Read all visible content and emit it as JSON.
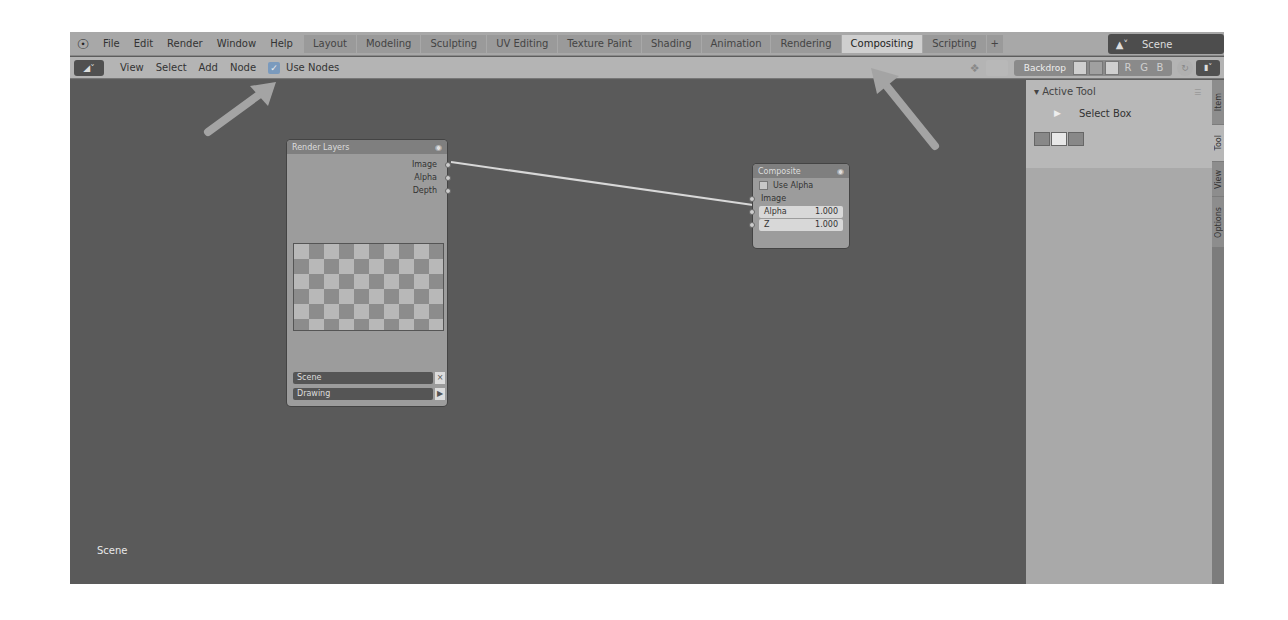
{
  "topbar": {
    "menu": [
      "File",
      "Edit",
      "Render",
      "Window",
      "Help"
    ],
    "workspaces": [
      {
        "label": "Layout",
        "active": false
      },
      {
        "label": "Modeling",
        "active": false
      },
      {
        "label": "Sculpting",
        "active": false
      },
      {
        "label": "UV Editing",
        "active": false
      },
      {
        "label": "Texture Paint",
        "active": false
      },
      {
        "label": "Shading",
        "active": false
      },
      {
        "label": "Animation",
        "active": false
      },
      {
        "label": "Rendering",
        "active": false
      },
      {
        "label": "Compositing",
        "active": true
      },
      {
        "label": "Scripting",
        "active": false
      }
    ],
    "add_workspace": "+",
    "scene": "Scene"
  },
  "editor_header": {
    "menu": [
      "View",
      "Select",
      "Add",
      "Node"
    ],
    "use_nodes_label": "Use Nodes",
    "use_nodes_checked": true,
    "backdrop_label": "Backdrop",
    "channels": [
      "R",
      "G",
      "B"
    ]
  },
  "nodes": {
    "render_layers": {
      "title": "Render Layers",
      "outputs": [
        "Image",
        "Alpha",
        "Depth"
      ],
      "scene": "Scene",
      "layer": "Drawing"
    },
    "composite": {
      "title": "Composite",
      "use_alpha_label": "Use Alpha",
      "input_image": "Image",
      "fields": [
        {
          "label": "Alpha",
          "value": "1.000"
        },
        {
          "label": "Z",
          "value": "1.000"
        }
      ]
    }
  },
  "canvas": {
    "scene_label": "Scene"
  },
  "sidebar": {
    "panel_title": "Active Tool",
    "tool_name": "Select Box",
    "tabs": [
      {
        "label": "Item",
        "active": false
      },
      {
        "label": "Tool",
        "active": true
      },
      {
        "label": "View",
        "active": false
      },
      {
        "label": "Options",
        "active": false
      }
    ]
  },
  "colors": {
    "canvas": "#5a5a5a",
    "topbar": "#a8a8a8",
    "active_tab": "#cfcfcf",
    "annotation_arrow": "#9e9e9e"
  }
}
